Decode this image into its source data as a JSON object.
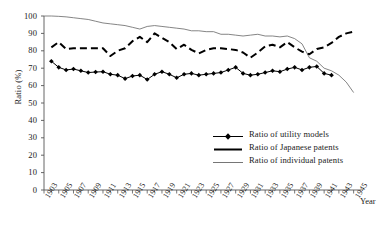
{
  "chart_data": {
    "type": "line",
    "title": "",
    "xlabel": "Year",
    "ylabel": "Ratio (%)",
    "ylim": [
      0,
      100
    ],
    "ytick_labels": [
      "0",
      "10",
      "20",
      "30",
      "40",
      "50",
      "60",
      "70",
      "80",
      "90",
      "100"
    ],
    "xlim": [
      1903,
      1946
    ],
    "x_tick_labels": [
      "1903",
      "1905",
      "1907",
      "1909",
      "1911",
      "1913",
      "1915",
      "1917",
      "1919",
      "1921",
      "1923",
      "1925",
      "1927",
      "1929",
      "1931",
      "1933",
      "1935",
      "1937",
      "1939",
      "1941",
      "1943",
      "1945"
    ],
    "grid": false,
    "legend_position": "center-right",
    "x": [
      1903,
      1904,
      1905,
      1906,
      1907,
      1908,
      1909,
      1910,
      1911,
      1912,
      1913,
      1914,
      1915,
      1916,
      1917,
      1918,
      1919,
      1920,
      1921,
      1922,
      1923,
      1924,
      1925,
      1926,
      1927,
      1928,
      1929,
      1930,
      1931,
      1932,
      1933,
      1934,
      1935,
      1936,
      1937,
      1938,
      1939,
      1940,
      1941,
      1942,
      1943,
      1944,
      1945
    ],
    "series": [
      {
        "name": "Ratio of utility models",
        "marker": "diamond",
        "line_style": "solid",
        "line_width": 1.0,
        "color": "#000000",
        "values": [
          null,
          74.0,
          70.5,
          69.0,
          69.5,
          68.5,
          67.5,
          67.8,
          68.0,
          66.5,
          66.0,
          64.0,
          65.5,
          66.0,
          63.5,
          66.5,
          68.0,
          66.5,
          64.5,
          66.5,
          67.0,
          66.0,
          66.5,
          67.0,
          67.5,
          69.0,
          70.5,
          67.0,
          66.0,
          66.5,
          67.5,
          68.5,
          68.0,
          69.5,
          70.5,
          69.0,
          70.5,
          71.0,
          67.0,
          66.0,
          null,
          null,
          null
        ]
      },
      {
        "name": "Ratio of Japanese patents",
        "marker": "none",
        "line_style": "dashed",
        "line_width": 2.0,
        "color": "#000000",
        "values": [
          null,
          82.0,
          85.0,
          81.0,
          81.5,
          81.5,
          81.5,
          81.5,
          81.5,
          77.0,
          80.0,
          81.5,
          85.5,
          88.0,
          85.0,
          90.0,
          87.5,
          85.0,
          81.0,
          83.5,
          80.5,
          78.5,
          80.5,
          81.5,
          81.5,
          81.0,
          80.5,
          79.0,
          76.0,
          79.0,
          82.5,
          83.5,
          82.0,
          85.0,
          82.0,
          79.5,
          78.0,
          81.0,
          82.0,
          84.5,
          88.0,
          90.0,
          91.0
        ]
      },
      {
        "name": "Ratio of individual patents",
        "marker": "none",
        "line_style": "solid",
        "line_width": 0.8,
        "color": "#666666",
        "values": [
          100.0,
          100.0,
          99.8,
          99.5,
          99.0,
          98.5,
          98.0,
          97.0,
          96.0,
          95.5,
          95.0,
          94.5,
          93.5,
          92.5,
          94.0,
          94.5,
          94.0,
          93.5,
          93.0,
          92.5,
          91.5,
          91.5,
          91.0,
          91.0,
          89.5,
          89.5,
          89.0,
          88.5,
          89.0,
          89.5,
          88.5,
          88.5,
          88.0,
          88.5,
          87.0,
          84.0,
          76.0,
          74.0,
          70.0,
          68.5,
          66.0,
          62.0,
          56.0
        ]
      }
    ]
  },
  "legend": {
    "items": [
      {
        "label": "Ratio of utility models"
      },
      {
        "label": "Ratio of Japanese patents"
      },
      {
        "label": "Ratio of individual patents"
      }
    ]
  }
}
